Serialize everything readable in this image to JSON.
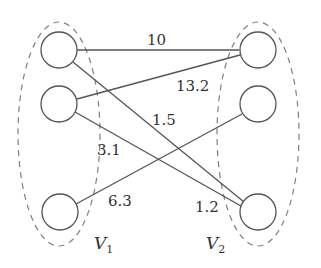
{
  "diagram": {
    "type": "bipartite-graph",
    "colors": {
      "stroke": "#555555",
      "dashed": "#777777",
      "text": "#333333",
      "background": "#ffffff"
    },
    "sets": [
      {
        "id": "V1",
        "label": "V",
        "subscript": "1"
      },
      {
        "id": "V2",
        "label": "V",
        "subscript": "2"
      }
    ],
    "nodes": [
      {
        "id": "L1",
        "set": "V1"
      },
      {
        "id": "L2",
        "set": "V1"
      },
      {
        "id": "L3",
        "set": "V1"
      },
      {
        "id": "R1",
        "set": "V2"
      },
      {
        "id": "R2",
        "set": "V2"
      },
      {
        "id": "R3",
        "set": "V2"
      }
    ],
    "edges": [
      {
        "from": "L1",
        "to": "R1"
      },
      {
        "from": "L1",
        "to": "R3"
      },
      {
        "from": "L2",
        "to": "R1"
      },
      {
        "from": "L2",
        "to": "R3"
      },
      {
        "from": "L3",
        "to": "R2"
      }
    ],
    "edge_labels": [
      "10",
      "13.2",
      "1.5",
      "3.1",
      "6.3",
      "1.2"
    ]
  }
}
